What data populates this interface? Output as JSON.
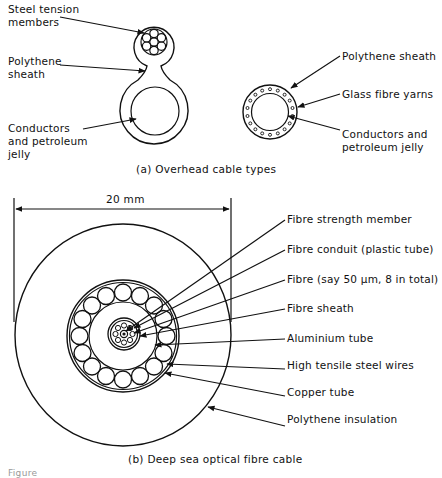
{
  "figure": {
    "part_a": {
      "caption": "(a)  Overhead cable types",
      "figure8_cable": {
        "labels": [
          {
            "id": "steel",
            "line1": "Steel tension",
            "line2": "members"
          },
          {
            "id": "sheath",
            "line1": "Polythene",
            "line2": "sheath"
          },
          {
            "id": "conductors",
            "line1": "Conductors",
            "line2": "and petroleum",
            "line3": "jelly"
          }
        ]
      },
      "round_cable": {
        "labels": [
          {
            "id": "sheath",
            "line1": "Polythene sheath"
          },
          {
            "id": "yarns",
            "line1": "Glass fibre yarns"
          },
          {
            "id": "conductors",
            "line1": "Conductors and",
            "line2": "petroleum jelly"
          }
        ]
      }
    },
    "part_b": {
      "caption": "(b)  Deep sea optical fibre cable",
      "dimension": "20 mm",
      "labels": [
        {
          "id": "strength",
          "text": "Fibre strength member"
        },
        {
          "id": "conduit",
          "text": "Fibre conduit (plastic tube)"
        },
        {
          "id": "fibre",
          "text": "Fibre (say 50 µm, 8 in total)"
        },
        {
          "id": "fsheath",
          "text": "Fibre sheath"
        },
        {
          "id": "aluminium",
          "text": "Aluminium tube"
        },
        {
          "id": "steelwires",
          "text": "High tensile steel wires"
        },
        {
          "id": "copper",
          "text": "Copper tube"
        },
        {
          "id": "insulation",
          "text": "Polythene insulation"
        }
      ]
    },
    "figure_number": "Figure"
  }
}
